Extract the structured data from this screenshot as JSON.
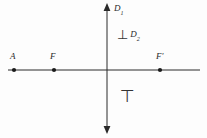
{
  "figure": {
    "kind": "geometry-diagram",
    "background_color": "#fdfdfd",
    "stroke_color": "#2a2a2a",
    "width": 207,
    "height": 138,
    "axes": {
      "vertical": {
        "name": "vertical-axis",
        "label": "D",
        "label_subscript": "1",
        "x": 107,
        "y_top": 4,
        "y_bottom": 132,
        "arrow_top": true,
        "arrow_bottom": true
      },
      "horizontal": {
        "name": "horizontal-axis",
        "x_left": 8,
        "x_right": 200,
        "y": 70,
        "arrow_left": false,
        "arrow_right": false
      }
    },
    "points": [
      {
        "id": "point-a",
        "label": "A",
        "prime": "",
        "x": 14,
        "y": 70,
        "label_x": 10,
        "label_y": 52
      },
      {
        "id": "point-f",
        "label": "F",
        "prime": "",
        "x": 54,
        "y": 70,
        "label_x": 50,
        "label_y": 52
      },
      {
        "id": "point-f-prime",
        "label": "F",
        "prime": "'",
        "x": 160,
        "y": 70,
        "label_x": 156,
        "label_y": 52
      }
    ],
    "annotations": [
      {
        "id": "perpendicular-annotation",
        "symbol": "⊥",
        "symbol_name": "perpendicular-symbol",
        "label": "D",
        "label_subscript": "2",
        "x": 117,
        "y": 29
      },
      {
        "id": "top-annotation",
        "symbol": "⊤",
        "symbol_name": "top-symbol",
        "x": 120,
        "y": 88
      }
    ],
    "axis_label_d1": {
      "text": "D",
      "subscript": "1",
      "x": 114,
      "y": 5
    }
  }
}
